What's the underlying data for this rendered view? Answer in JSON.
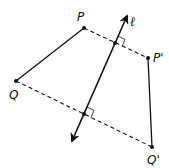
{
  "diagram": {
    "labels": {
      "P": "P",
      "Q": "Q",
      "P_prime": "P'",
      "Q_prime": "Q'",
      "line": "ℓ"
    },
    "points": {
      "P": [
        84,
        28
      ],
      "Q": [
        16,
        81
      ],
      "P_prime": [
        148,
        58
      ],
      "Q_prime": [
        152,
        147
      ],
      "line_top": [
        127,
        16
      ],
      "line_bottom": [
        72,
        141
      ],
      "foot_P": [
        115,
        43
      ],
      "foot_Q": [
        84,
        114
      ]
    },
    "colors": {
      "stroke": "#111111",
      "background": "#ffffff"
    }
  }
}
